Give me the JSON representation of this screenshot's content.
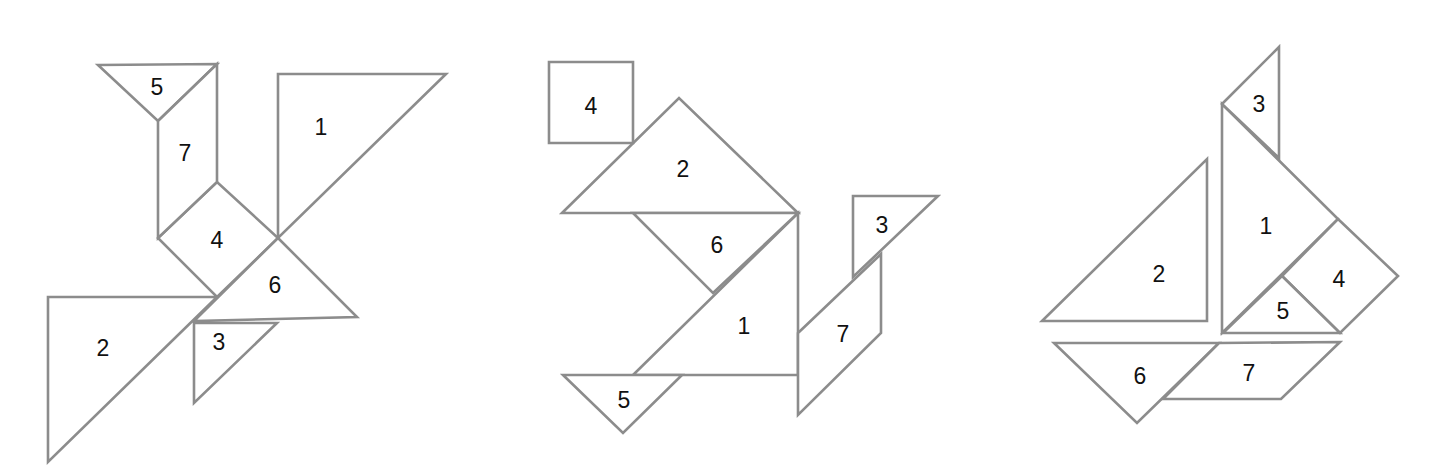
{
  "colors": {
    "stroke": "#8c8c8c",
    "fill": "#ffffff",
    "label": "#111111"
  },
  "figures": [
    {
      "name": "bird",
      "pieces": [
        {
          "label": "1",
          "points": "278,74 446,74 278,238",
          "lx": 321,
          "ly": 127
        },
        {
          "label": "2",
          "points": "48,297 217,297 48,462",
          "lx": 103,
          "ly": 348
        },
        {
          "label": "3",
          "points": "194,323 277,323 194,403",
          "lx": 219,
          "ly": 342
        },
        {
          "label": "4",
          "points": "158,238 217,182 278,238 217,297",
          "lx": 217,
          "ly": 240
        },
        {
          "label": "5",
          "points": "98,65 217,64 158,121",
          "lx": 157,
          "ly": 87
        },
        {
          "label": "6",
          "points": "278,238 357,317 194,321",
          "lx": 275,
          "ly": 285
        },
        {
          "label": "7",
          "points": "158,121 217,64 217,182 158,238",
          "lx": 185,
          "ly": 153
        }
      ]
    },
    {
      "name": "swan",
      "pieces": [
        {
          "label": "1",
          "points": "798,213 798,375 633,375",
          "lx": 744,
          "ly": 326
        },
        {
          "label": "2",
          "points": "562,213 679,98 798,213",
          "lx": 683,
          "ly": 169
        },
        {
          "label": "3",
          "points": "853,196 938,196 853,277",
          "lx": 882,
          "ly": 225
        },
        {
          "label": "4",
          "points": "549,62 633,62 633,143 549,143",
          "lx": 591,
          "ly": 106
        },
        {
          "label": "5",
          "points": "563,375 682,375 623,433",
          "lx": 624,
          "ly": 400
        },
        {
          "label": "6",
          "points": "633,213 798,213 713,293",
          "lx": 717,
          "ly": 245
        },
        {
          "label": "7",
          "points": "798,333 881,254 881,333 798,415",
          "lx": 843,
          "ly": 334
        }
      ]
    },
    {
      "name": "sailboat",
      "pieces": [
        {
          "label": "1",
          "points": "1222,104 1338,219 1222,333",
          "lx": 1266,
          "ly": 226
        },
        {
          "label": "2",
          "points": "1207,159 1207,321 1042,321",
          "lx": 1159,
          "ly": 274
        },
        {
          "label": "3",
          "points": "1222,104 1279,47 1279,158",
          "lx": 1259,
          "ly": 104
        },
        {
          "label": "4",
          "points": "1338,219 1398,276 1340,333 1282,276",
          "lx": 1339,
          "ly": 279
        },
        {
          "label": "5",
          "points": "1282,276 1340,333 1223,333",
          "lx": 1283,
          "ly": 311
        },
        {
          "label": "6",
          "points": "1054,343 1219,343 1137,423",
          "lx": 1140,
          "ly": 376
        },
        {
          "label": "7",
          "points": "1219,343 1340,342 1281,399 1163,399",
          "lx": 1249,
          "ly": 373
        }
      ]
    }
  ]
}
